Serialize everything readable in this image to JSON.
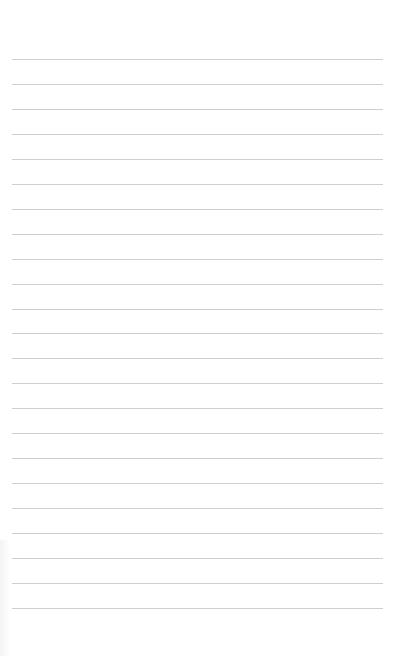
{
  "page": {
    "type": "lined-paper",
    "background": "#ffffff",
    "rule_color": "#cfcfcf",
    "rules": {
      "count": 23,
      "first_y": 59,
      "spacing": 24.95,
      "left": 12,
      "width": 371
    },
    "text": []
  }
}
